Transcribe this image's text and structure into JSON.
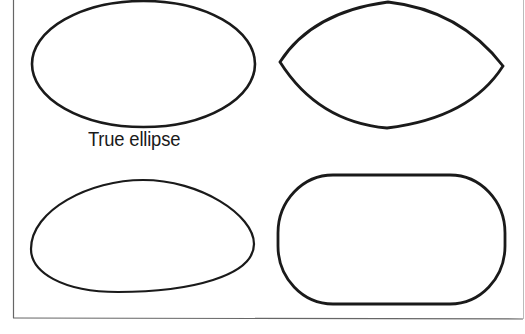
{
  "diagram": {
    "shapes": [
      {
        "id": "true-ellipse",
        "label": "True ellipse",
        "position": "top-left"
      },
      {
        "id": "pointed-ellipse",
        "label": "",
        "position": "top-right"
      },
      {
        "id": "egg-oval",
        "label": "",
        "position": "bottom-left"
      },
      {
        "id": "rounded-rectangle",
        "label": "",
        "position": "bottom-right"
      }
    ],
    "stroke_color": "#1a1a1a",
    "border_color": "#555555"
  }
}
